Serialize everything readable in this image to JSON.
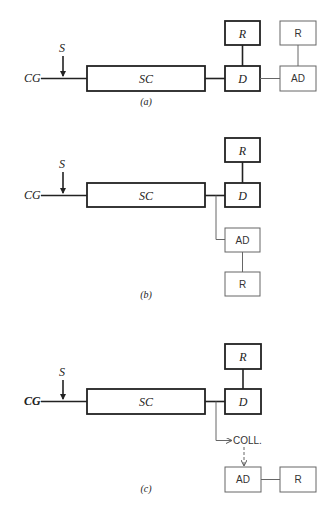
{
  "diagrams": [
    {
      "id": "a",
      "caption": "(a)",
      "labels": {
        "input": "CG",
        "signal": "S",
        "main": "SC",
        "detector": "D",
        "recorder_top": "R",
        "aux": "AD",
        "aux_recorder": "R"
      }
    },
    {
      "id": "b",
      "caption": "(b)",
      "labels": {
        "input": "CG",
        "signal": "S",
        "main": "SC",
        "detector": "D",
        "recorder_top": "R",
        "aux": "AD",
        "aux_recorder": "R"
      }
    },
    {
      "id": "c",
      "caption": "(c)",
      "labels": {
        "input": "CG",
        "signal": "S",
        "main": "SC",
        "detector": "D",
        "recorder_top": "R",
        "collector": "COLL.",
        "aux": "AD",
        "aux_recorder": "R"
      }
    }
  ]
}
